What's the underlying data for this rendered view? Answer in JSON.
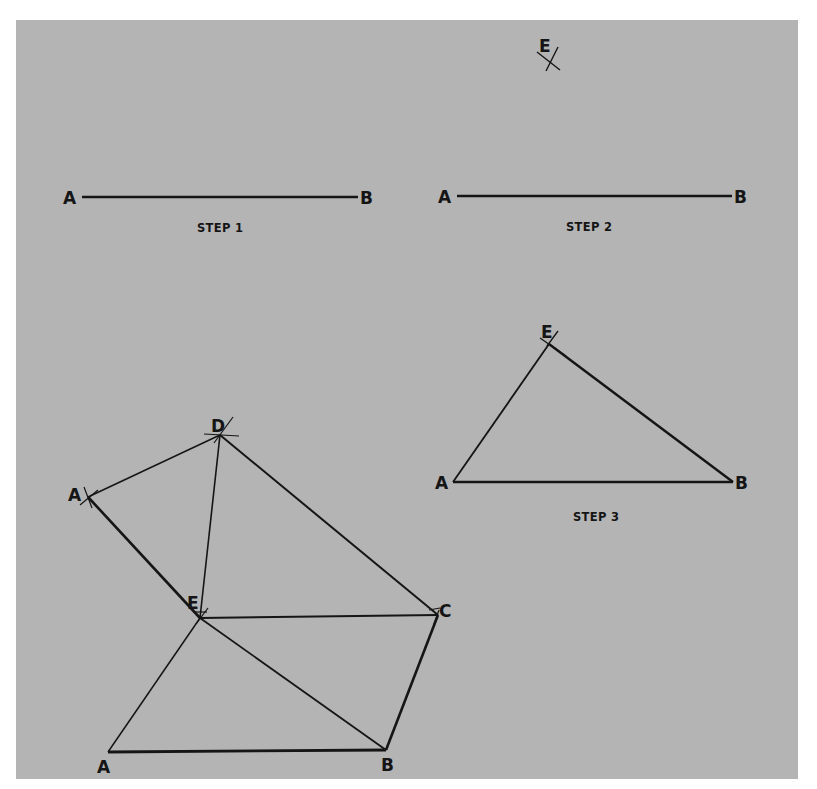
{
  "figure": {
    "background_color": "#ffffff",
    "panel_color": "#b4b4b4",
    "ink_color": "#151515",
    "steps": [
      {
        "caption": "STEP 1",
        "points": {
          "A": "A",
          "B": "B"
        },
        "segments": [
          "AB"
        ]
      },
      {
        "caption": "STEP 2",
        "points": {
          "A": "A",
          "B": "B",
          "E": "E"
        },
        "segments": [
          "AB"
        ],
        "arc_marks": [
          "E"
        ]
      },
      {
        "caption": "STEP 3",
        "points": {
          "A": "A",
          "B": "B",
          "E": "E"
        },
        "segments": [
          "AB",
          "AE",
          "EB"
        ]
      },
      {
        "caption": "",
        "points": {
          "A_bottom": "A",
          "B": "B",
          "C": "C",
          "D": "D",
          "A_upper": "A",
          "E": "E"
        },
        "segments": [
          "AB",
          "BC",
          "CD",
          "DA",
          "AE",
          "BE",
          "CE",
          "DE",
          "A'E"
        ],
        "arc_marks": [
          "D",
          "A",
          "E",
          "C"
        ]
      }
    ]
  }
}
